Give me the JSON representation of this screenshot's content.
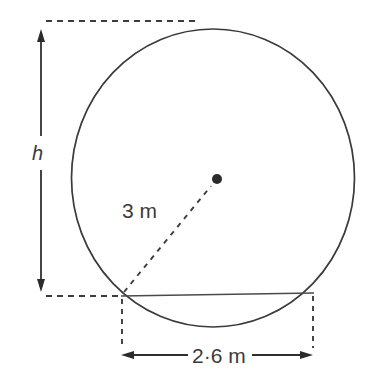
{
  "diagram": {
    "shape": "circle",
    "circle": {
      "center_x": 213,
      "center_y": 178,
      "radius": 141.5,
      "stroke_color": "#3a3a3a"
    },
    "center_point": {
      "name": "circle-centre",
      "x": 217,
      "y": 179,
      "radius": 5,
      "color": "#2b2b2b"
    },
    "labels": {
      "height": "h",
      "radius": "3 m",
      "width": "2·6 m"
    },
    "chord": {
      "x1": 121,
      "y1": 296,
      "x2": 313,
      "y2": 293
    },
    "dimensions": {
      "height_arrow": {
        "x": 41,
        "top_y": 30,
        "bottom_y": 291,
        "label": "h"
      },
      "width_arrow": {
        "y": 355,
        "left_x": 122,
        "right_x": 313,
        "label": "2·6 m"
      },
      "radius_line": {
        "from_x": 123,
        "from_y": 293,
        "to_x": 212,
        "to_y": 185,
        "label": "3 m"
      }
    },
    "guides": {
      "top_dashed": {
        "x1": 46,
        "y1": 21,
        "x2": 196,
        "y2": 21
      },
      "bottom_dashed": {
        "x1": 46,
        "y1": 296,
        "x2": 122,
        "y2": 296
      },
      "left_drop_dashed": {
        "x": 122,
        "y1": 298,
        "y2": 347
      },
      "right_drop_dashed": {
        "x": 313,
        "y1": 295,
        "y2": 347
      }
    },
    "colors": {
      "ink": "#3a3a3a",
      "background": "#ffffff"
    }
  }
}
